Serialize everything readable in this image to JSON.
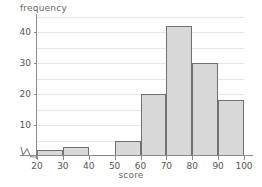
{
  "chart_data": {
    "type": "bar",
    "title": "",
    "xlabel": "score",
    "ylabel": "frequency",
    "categories": [
      "20-30",
      "30-40",
      "40-50",
      "50-60",
      "60-70",
      "70-80",
      "80-90",
      "90-100"
    ],
    "bin_edges": [
      20,
      30,
      40,
      50,
      60,
      70,
      80,
      90,
      100
    ],
    "values": [
      2,
      3,
      0,
      5,
      20,
      42,
      30,
      18
    ],
    "xlim": [
      20,
      100
    ],
    "ylim": [
      0,
      45
    ],
    "xticks": [
      20,
      30,
      40,
      50,
      60,
      70,
      80,
      90,
      100
    ],
    "yticks": [
      10,
      20,
      30,
      40
    ],
    "gridlines_y": [
      5,
      10,
      15,
      20,
      25,
      30,
      35,
      40,
      45
    ],
    "grid": true,
    "legend": null,
    "axis_break": "x-axis-zigzag-near-origin",
    "colors": {
      "bar_fill": "#d8d8d8",
      "bar_stroke": "#707070",
      "gridline": "#e7e7e7",
      "axis": "#8a8a8a",
      "text": "#555555",
      "background": "#ffffff"
    }
  },
  "axes": {
    "y_title": "frequency",
    "x_title": "score",
    "y_tick_labels": [
      "10",
      "20",
      "30",
      "40"
    ],
    "x_tick_labels": [
      "20",
      "30",
      "40",
      "50",
      "60",
      "70",
      "80",
      "90",
      "100"
    ]
  }
}
